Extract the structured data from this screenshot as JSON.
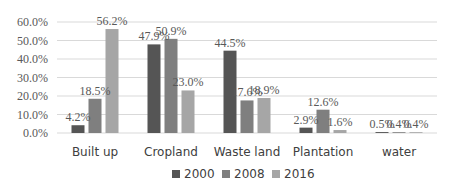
{
  "chart_data": {
    "type": "bar",
    "title": "",
    "xlabel": "",
    "ylabel": "",
    "categories": [
      "Built up",
      "Cropland",
      "Waste land",
      "Plantation",
      "water"
    ],
    "series": [
      {
        "name": "2000",
        "color": "#555555",
        "values": [
          4.2,
          47.9,
          44.5,
          2.9,
          0.5
        ],
        "labels": [
          "4.2%",
          "47.9%",
          "44.5%",
          "2.9%",
          "0.5%"
        ]
      },
      {
        "name": "2008",
        "color": "#7f7f7f",
        "values": [
          18.5,
          50.9,
          17.6,
          12.6,
          0.4
        ],
        "labels": [
          "18.5%",
          "50.9%",
          "17.6%",
          "12.6%",
          "0.4%"
        ]
      },
      {
        "name": "2016",
        "color": "#a6a6a6",
        "values": [
          56.2,
          23.0,
          18.9,
          1.6,
          0.4
        ],
        "labels": [
          "56.2%",
          "23.0%",
          "18.9%",
          "1.6%",
          "0.4%"
        ]
      }
    ],
    "ylim": [
      0,
      60
    ],
    "yticks": [
      "0.0%",
      "10.0%",
      "20.0%",
      "30.0%",
      "40.0%",
      "50.0%",
      "60.0%"
    ],
    "grid": true,
    "legend_position": "bottom"
  }
}
